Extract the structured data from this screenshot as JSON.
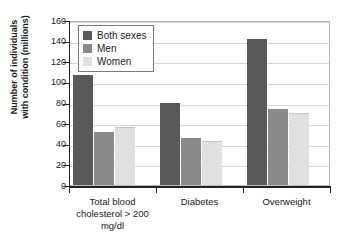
{
  "chart_data": {
    "type": "bar",
    "title": "",
    "xlabel": "",
    "ylabel": "Number of individuals with condition (millions)",
    "ylabel_line1": "Number of individuals",
    "ylabel_line2": "with condition (millions)",
    "ylim": [
      0,
      160
    ],
    "ytick_step": 20,
    "yticks": [
      160,
      140,
      120,
      100,
      80,
      60,
      40,
      20,
      0
    ],
    "grid": true,
    "legend_position": "top-left-inside",
    "categories": [
      "Total blood cholesterol > 200 mg/dl",
      "Diabetes",
      "Overweight"
    ],
    "category_lines": [
      [
        "Total blood",
        "cholesterol > 200",
        "mg/dl"
      ],
      [
        "Diabetes"
      ],
      [
        "Overweight"
      ]
    ],
    "series": [
      {
        "name": "Both sexes",
        "color": "#595959",
        "values": [
          107,
          80,
          142
        ]
      },
      {
        "name": "Men",
        "color": "#8a8a8a",
        "values": [
          51,
          46,
          74
        ]
      },
      {
        "name": "Women",
        "color": "#e0e0e0",
        "values": [
          55,
          42,
          69
        ]
      }
    ]
  },
  "legend": {
    "items": [
      {
        "label": "Both sexes",
        "color": "#595959"
      },
      {
        "label": "Men",
        "color": "#8a8a8a"
      },
      {
        "label": "Women",
        "color": "#e0e0e0"
      }
    ]
  }
}
